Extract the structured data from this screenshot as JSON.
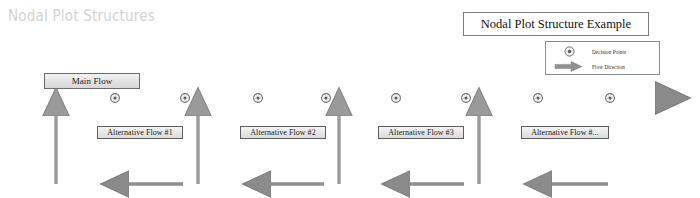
{
  "page": {
    "title": "Nodal Plot Structures",
    "width": 700,
    "height": 198,
    "background": "#ffffff",
    "title_color": "#d2d2d2"
  },
  "legend": {
    "title": "Nodal Plot Structure Example",
    "items": [
      {
        "icon": "decision-node-icon",
        "label": "Decision Points"
      },
      {
        "icon": "flow-arrow-icon",
        "label": "Flow Direction"
      }
    ]
  },
  "diagram": {
    "main_flow_label": "Main Flow",
    "alternative_flows": [
      {
        "label": "Alternative Flow #1"
      },
      {
        "label": "Alternative Flow #2"
      },
      {
        "label": "Alternative Flow #3"
      },
      {
        "label": "Alternative Flow #..."
      }
    ],
    "node_count": 8,
    "colors": {
      "line": "#8e8e8e",
      "line_dark": "#6f6f6f",
      "node_fill": "#9a9a9a",
      "node_stroke": "#707070",
      "box_border": "#5e5e5e",
      "box_fill": "#e6e6e6"
    }
  }
}
